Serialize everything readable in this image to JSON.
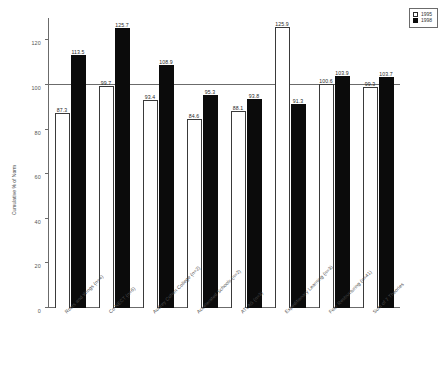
{
  "chart_data": {
    "type": "bar",
    "title": "",
    "subtitle": "",
    "xlabel": "",
    "ylabel": "Cumulative % of Norm",
    "ylim": [
      0,
      130
    ],
    "yticks": [
      0,
      20,
      40,
      60,
      80,
      100,
      120
    ],
    "grid": false,
    "reference_line": 100,
    "legend_position": "top-right",
    "categories": [
      "Roots and Wings (n=4)",
      "Co-NECT (n=6)",
      "Audrey Cohen College (n=2)",
      "Accelerated Schools (n=2)",
      "ATLAS (n=3)",
      "Expeditionary Learning (n=3)",
      "Four Restructuring (n=41)",
      "Sum of 7 Theories"
    ],
    "series": [
      {
        "name": "1995",
        "color": "#ffffff",
        "values": [
          87.3,
          99.7,
          93.4,
          84.6,
          88.1,
          125.9,
          100.6,
          99.3
        ]
      },
      {
        "name": "1998",
        "color": "#0b0b0b",
        "values": [
          113.5,
          125.7,
          108.9,
          95.3,
          93.8,
          91.3,
          103.9,
          103.7
        ]
      }
    ]
  },
  "legend": {
    "items": [
      {
        "label": "1995",
        "swatch": "white-square-swatch"
      },
      {
        "label": "1998",
        "swatch": "black-square-swatch"
      }
    ]
  },
  "axes": {
    "y_title": "Cumulative % of Norm",
    "y_tick_labels": [
      "0",
      "20",
      "40",
      "60",
      "80",
      "100",
      "120"
    ]
  }
}
